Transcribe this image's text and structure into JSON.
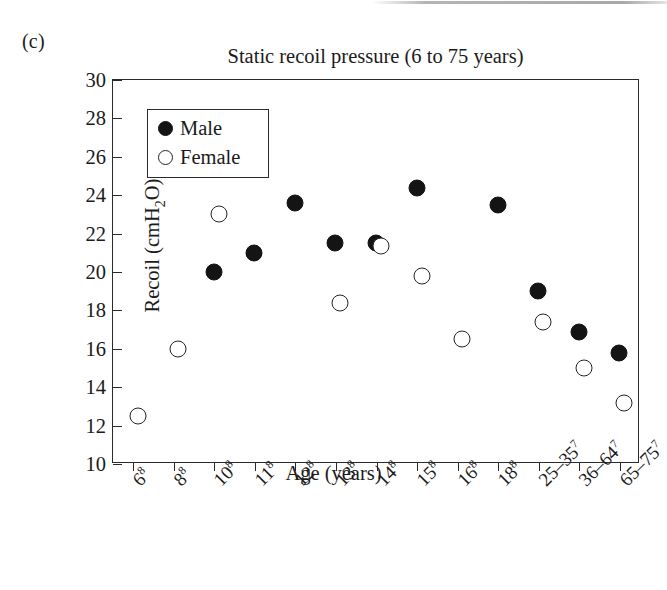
{
  "panel": {
    "label": "(c)"
  },
  "axis_titles": {
    "x": "Age (years)",
    "y_prefix": "Recoil (cmH",
    "y_sub": "2",
    "y_suffix": "O)"
  },
  "legend": {
    "male_label": "Male",
    "female_label": "Female"
  },
  "chart_data": {
    "type": "scatter",
    "title": "Static recoil pressure (6 to 75 years)",
    "xlabel": "Age (years)",
    "ylabel": "Recoil (cmH2O)",
    "ylim": [
      10,
      30
    ],
    "yticks": [
      30,
      28,
      26,
      24,
      22,
      20,
      18,
      16,
      14,
      12,
      10
    ],
    "grid": false,
    "legend_position": "top-left",
    "categories": [
      "6",
      "8",
      "10",
      "11",
      "12",
      "13",
      "14",
      "15",
      "16",
      "18",
      "25–35",
      "36–64",
      "65–75"
    ],
    "category_superscripts": [
      "8",
      "8",
      "8",
      "8",
      "8",
      "8",
      "8",
      "8",
      "8",
      "8",
      "7",
      "7",
      "7"
    ],
    "series": [
      {
        "name": "Male",
        "marker": "filled-circle",
        "color": "#141414",
        "values": [
          null,
          null,
          20.0,
          21.0,
          23.6,
          21.5,
          21.5,
          24.4,
          null,
          23.5,
          19.0,
          16.9,
          15.8
        ]
      },
      {
        "name": "Female",
        "marker": "open-circle",
        "color": "#242424",
        "values": [
          12.5,
          16.0,
          23.0,
          null,
          null,
          18.4,
          21.35,
          19.8,
          16.5,
          null,
          17.4,
          15.0,
          13.2
        ]
      }
    ]
  }
}
